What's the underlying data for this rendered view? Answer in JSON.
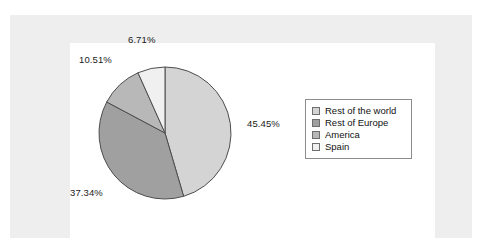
{
  "figure": {
    "background_color": "#eeeeee",
    "plot_background_color": "#ffffff"
  },
  "chart_data": {
    "type": "pie",
    "title": "",
    "xlabel": "",
    "ylabel": "",
    "legend_position": "right",
    "grid": false,
    "start_angle_deg": 0,
    "direction": "clockwise",
    "categories": [
      "Rest of the world",
      "Rest of Europe",
      "America",
      "Spain"
    ],
    "values": [
      45.45,
      37.34,
      10.51,
      6.71
    ],
    "labels": [
      "45.45%",
      "37.34%",
      "10.51%",
      "6.71%"
    ],
    "colors": [
      "#d4d4d4",
      "#a0a0a0",
      "#b8b8b8",
      "#f0f0f0"
    ],
    "slice_outline_color": "#4d4d4d",
    "units": "percent"
  },
  "legend": {
    "border_color": "#8c8c8c",
    "items": [
      {
        "label": "Rest of the world",
        "color": "#d4d4d4"
      },
      {
        "label": "Rest of Europe",
        "color": "#a0a0a0"
      },
      {
        "label": "America",
        "color": "#b8b8b8"
      },
      {
        "label": "Spain",
        "color": "#f0f0f0"
      }
    ]
  },
  "caption": {
    "remnant_text": ""
  }
}
